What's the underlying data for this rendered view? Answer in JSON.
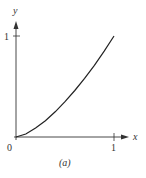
{
  "chart_data": {
    "type": "line",
    "title": "",
    "caption": "(a)",
    "xlabel": "x",
    "ylabel": "y",
    "xlim": [
      0,
      1
    ],
    "ylim": [
      0,
      1
    ],
    "x_ticks": [
      "0",
      "1"
    ],
    "y_ticks": [
      "1"
    ],
    "grid": false,
    "series": [
      {
        "name": "curve",
        "x": [
          0,
          0.1,
          0.2,
          0.3,
          0.4,
          0.5,
          0.6,
          0.7,
          0.8,
          0.9,
          1.0
        ],
        "values": [
          0,
          0.03,
          0.09,
          0.16,
          0.25,
          0.35,
          0.46,
          0.58,
          0.71,
          0.85,
          1.0
        ]
      }
    ]
  },
  "labels": {
    "origin": "0",
    "x_tick_1": "1",
    "y_tick_1": "1",
    "x_axis": "x",
    "y_axis": "y",
    "caption": "(a)"
  }
}
